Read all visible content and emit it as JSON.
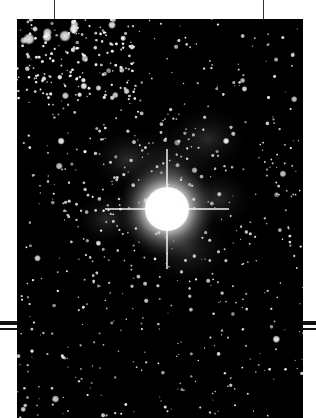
{
  "image": {
    "subject": "star field with bright central star",
    "palette": {
      "sky": "#000000",
      "star": "#ffffff",
      "nebula": "#3a3a3a",
      "border": "#ffffff",
      "guides": "#222222"
    },
    "features": [
      "bright central star with diffraction spikes",
      "dense cluster of stars upper-left",
      "faint nebulous filaments around central star",
      "scattered field stars"
    ]
  }
}
